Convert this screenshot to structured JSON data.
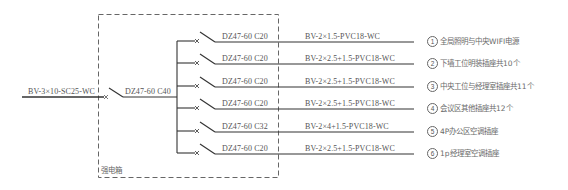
{
  "diagram": {
    "title": "",
    "box_label": "强电箱",
    "incoming": {
      "cable": "BV-3×10-SC25-WC",
      "main_breaker": "DZ47-60 C40"
    },
    "circuits": [
      {
        "number": "1",
        "breaker": "DZ47-60 C20",
        "cable": "BV-2×1.5-PVC18-WC",
        "description": "全局照明与中央WIFI电源"
      },
      {
        "number": "2",
        "breaker": "DZ47-60 C20",
        "cable": "BV-2×2.5+1.5-PVC18-WC",
        "description": "下墙工位明装插座共10个"
      },
      {
        "number": "3",
        "breaker": "DZ47-60 C20",
        "cable": "BV-2×2.5+1.5-PVC18-WC",
        "description": "中央工位与经理室插座共11个"
      },
      {
        "number": "4",
        "breaker": "DZ47-60 C20",
        "cable": "BV-2×2.5+1.5-PVC18-WC",
        "description": "会议区其他插座共12个"
      },
      {
        "number": "5",
        "breaker": "DZ47-60 C32",
        "cable": "BV-2×4+1.5-PVC18-WC",
        "description": "4P办公区空调插座"
      },
      {
        "number": "6",
        "breaker": "DZ47-60 C20",
        "cable": "BV-2×2.5+1.5-PVC18-WC",
        "description": "1p经理室空调插座"
      }
    ],
    "colors": {
      "line": "#3a3a3a",
      "dashed_box": "#555555",
      "text": "#555555"
    }
  }
}
